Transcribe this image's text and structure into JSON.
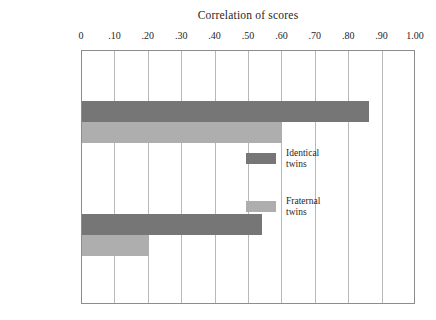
{
  "chart_data": {
    "type": "bar",
    "orientation": "horizontal",
    "title": "Correlation of scores",
    "xlabel": "Correlation of scores",
    "ylabel": "",
    "xlim": [
      0,
      1.0
    ],
    "grid": true,
    "legend_position": "inside-right",
    "tick_labels": [
      "0",
      ".10",
      ".20",
      ".30",
      ".40",
      ".50",
      ".60",
      ".70",
      ".80",
      ".90",
      "1.00"
    ],
    "tick_values": [
      0,
      0.1,
      0.2,
      0.3,
      0.4,
      0.5,
      0.6,
      0.7,
      0.8,
      0.9,
      1.0
    ],
    "categories": [
      "Intelligence",
      "Personality"
    ],
    "category_labels": [
      {
        "main": "Intelligence",
        "sub": ""
      },
      {
        "main": "Personality",
        "sub": "(extraversion)"
      }
    ],
    "series": [
      {
        "name": "Identical twins",
        "color": "#767676",
        "values": [
          0.86,
          0.54
        ]
      },
      {
        "name": "Fraternal twins",
        "color": "#aeaeae",
        "values": [
          0.6,
          0.2
        ]
      }
    ]
  },
  "legend": {
    "items": [
      {
        "label_line1": "Identical",
        "label_line2": "twins",
        "color": "#767676"
      },
      {
        "label_line1": "Fraternal",
        "label_line2": "twins",
        "color": "#aeaeae"
      }
    ]
  }
}
